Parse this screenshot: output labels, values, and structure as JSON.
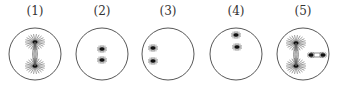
{
  "cells": [
    {
      "label": "(1)",
      "cx": 35,
      "asters": [
        [
          35,
          42
        ],
        [
          35,
          66
        ]
      ],
      "spindle": true,
      "extra": null
    },
    {
      "label": "(2)",
      "cx": 102,
      "asters": [
        [
          102,
          49
        ],
        [
          102,
          60
        ]
      ],
      "spindle": false,
      "extra": null
    },
    {
      "label": "(3)",
      "cx": 168,
      "asters": [
        [
          153,
          48
        ],
        [
          153,
          61
        ]
      ],
      "spindle": false,
      "extra": null
    },
    {
      "label": "(4)",
      "cx": 236,
      "asters": [
        [
          236,
          35
        ],
        [
          237,
          47
        ]
      ],
      "spindle": false,
      "extra": null
    },
    {
      "label": "(5)",
      "cx": 303,
      "asters": [
        [
          296,
          43
        ],
        [
          296,
          66
        ]
      ],
      "spindle": true,
      "extra": [
        [
          311,
          55
        ],
        [
          323,
          55
        ]
      ]
    }
  ]
}
